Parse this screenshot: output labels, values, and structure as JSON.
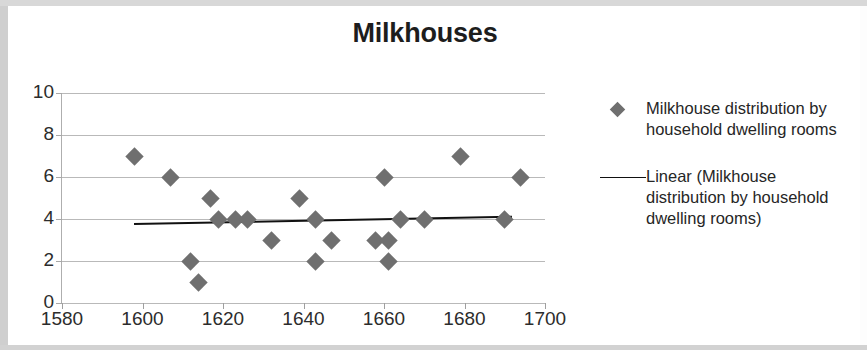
{
  "chart_data": {
    "type": "scatter",
    "title": "Milkhouses",
    "xlabel": "",
    "ylabel": "",
    "xlim": [
      1580,
      1700
    ],
    "ylim": [
      0,
      10
    ],
    "xticks": [
      1580,
      1600,
      1620,
      1640,
      1660,
      1680,
      1700
    ],
    "yticks": [
      0,
      2,
      4,
      6,
      8,
      10
    ],
    "grid": "horizontal",
    "legend_position": "right",
    "marker_color": "#6f6f6f",
    "trendline_color": "#111111",
    "gridline_color": "#b9b9b9",
    "series": [
      {
        "name": "Milkhouse distribution by household dwelling rooms",
        "marker": "diamond",
        "points": [
          {
            "x": 1598,
            "y": 7
          },
          {
            "x": 1607,
            "y": 6
          },
          {
            "x": 1612,
            "y": 2
          },
          {
            "x": 1614,
            "y": 1
          },
          {
            "x": 1617,
            "y": 5
          },
          {
            "x": 1619,
            "y": 4
          },
          {
            "x": 1623,
            "y": 4
          },
          {
            "x": 1626,
            "y": 4
          },
          {
            "x": 1632,
            "y": 3
          },
          {
            "x": 1639,
            "y": 5
          },
          {
            "x": 1643,
            "y": 4
          },
          {
            "x": 1643,
            "y": 2
          },
          {
            "x": 1647,
            "y": 3
          },
          {
            "x": 1658,
            "y": 3
          },
          {
            "x": 1660,
            "y": 6
          },
          {
            "x": 1661,
            "y": 3
          },
          {
            "x": 1661,
            "y": 2
          },
          {
            "x": 1664,
            "y": 4
          },
          {
            "x": 1670,
            "y": 4
          },
          {
            "x": 1679,
            "y": 7
          },
          {
            "x": 1690,
            "y": 4
          },
          {
            "x": 1694,
            "y": 6
          }
        ]
      },
      {
        "name": "Linear (Milkhouse distribution by household dwelling rooms)",
        "type": "line",
        "trendline": {
          "x0": 1598,
          "y0": 3.82,
          "x1": 1692,
          "y1": 4.17
        }
      }
    ],
    "legend": [
      {
        "marker": "diamond",
        "label": "Milkhouse distribution by household dwelling rooms"
      },
      {
        "marker": "line",
        "label": "Linear (Milkhouse distribution by household dwelling rooms)"
      }
    ]
  }
}
